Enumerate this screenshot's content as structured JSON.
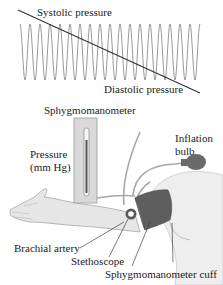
{
  "waveform": {
    "labels": {
      "systolic": "Systolic pressure",
      "diastolic": "Diastolic pressure"
    },
    "cycles": 18,
    "x_start": 20,
    "x_end": 200,
    "y_top": 24,
    "y_bottom": 80,
    "threshold_line": {
      "x1": 18,
      "y1": 10,
      "x2": 200,
      "y2": 93
    },
    "wave_color": "#9a9a9a",
    "line_color": "#333333"
  },
  "apparatus": {
    "labels": {
      "sphygmomanometer": "Sphygmomanometer",
      "pressure_line1": "Pressure",
      "pressure_line2": "(mm Hg)",
      "inflation_line1": "Inflation",
      "inflation_line2": "bulb",
      "brachial_artery": "Brachial artery",
      "stethoscope": "Stethoscope",
      "cuff": "Sphygmomanometer cuff"
    },
    "colors": {
      "gauge_panel": "#d9d9d9",
      "gauge_border": "#9a9a9a",
      "mercury": "#555555",
      "tube": "#a8a8a8",
      "bulb": "#6a6a6a",
      "cuff": "#5e5e5e",
      "cuff_dark": "#4a4a4a",
      "arm": "#e6e6e6",
      "arm_outline": "#9c9c9c",
      "body": "#eeeeee",
      "leader": "#444444"
    }
  }
}
